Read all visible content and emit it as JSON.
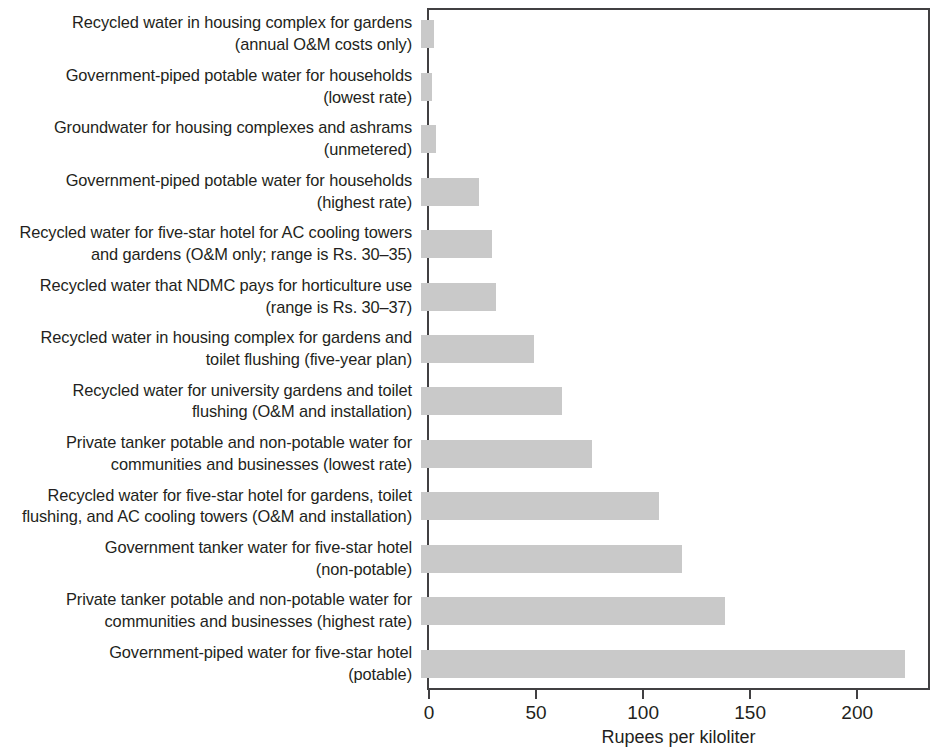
{
  "chart_data": {
    "type": "bar",
    "orientation": "horizontal",
    "title": "",
    "subtitle": "",
    "xlabel": "Rupees per kiloliter",
    "ylabel": "",
    "xlim": [
      0,
      234
    ],
    "xticks": [
      0,
      50,
      100,
      150,
      200
    ],
    "xticklabels": [
      "0",
      "50",
      "100",
      "150",
      "200"
    ],
    "grid": false,
    "legend": null,
    "bar_color": "#c9c9c9",
    "axis_color": "#414042",
    "text_color": "#231f20",
    "categories": [
      "Recycled water in housing complex for gardens\n(annual O&M costs only)",
      "Government-piped potable water for households\n(lowest rate)",
      "Groundwater for housing complexes and ashrams\n(unmetered)",
      "Government-piped potable water for households\n(highest rate)",
      "Recycled water for five-star hotel for AC cooling towers\nand gardens (O&M only; range is Rs. 30–35)",
      "Recycled water that NDMC pays for horticulture use\n(range is Rs. 30–37)",
      "Recycled water in housing complex for gardens and\ntoilet flushing (five-year plan)",
      "Recycled water for university gardens and toilet\nflushing (O&M and installation)",
      "Private tanker potable and non-potable water for\ncommunities and businesses (lowest rate)",
      "Recycled water for five-star hotel for gardens, toilet\nflushing, and AC cooling towers (O&M and installation)",
      "Government tanker water for five-star hotel\n(non-potable)",
      "Private tanker potable and non-potable water for\ncommunities and businesses (highest rate)",
      "Government-piped water for five-star hotel\n(potable)"
    ],
    "values": [
      6,
      5,
      7,
      27,
      33,
      35,
      53,
      66,
      80,
      111,
      122,
      142,
      226
    ]
  }
}
